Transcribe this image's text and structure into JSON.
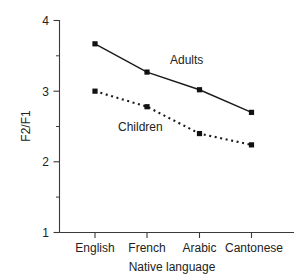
{
  "chart_data": {
    "type": "line",
    "title": "",
    "xlabel": "Native language",
    "ylabel": "F2/F1",
    "categories": [
      "English",
      "French",
      "Arabic",
      "Cantonese"
    ],
    "series": [
      {
        "name": "Adults",
        "style": "solid",
        "marker": "square",
        "values": [
          3.67,
          3.27,
          3.02,
          2.7
        ]
      },
      {
        "name": "Children",
        "style": "dotted",
        "marker": "square",
        "values": [
          3.0,
          2.78,
          2.4,
          2.24
        ]
      }
    ],
    "ylim": [
      1,
      4
    ],
    "yticks": [
      1,
      2,
      3,
      4
    ],
    "ytick_labels": [
      "1",
      "2",
      "3",
      "4"
    ],
    "yticks_minor": [
      1.5,
      2.5,
      3.5
    ],
    "grid": false,
    "legend": "inline-annotations"
  },
  "axes": {
    "y_tick_1": "1",
    "y_tick_2": "2",
    "y_tick_3": "3",
    "y_tick_4": "4",
    "y_axis_title": "F2/F1",
    "x_axis_title": "Native language",
    "x_cat_0": "English",
    "x_cat_1": "French",
    "x_cat_2": "Arabic",
    "x_cat_3": "Cantonese"
  },
  "annotations": {
    "adults": "Adults",
    "children": "Children"
  },
  "colors": {
    "line": "#1a1a1a",
    "axis": "#3a3a3a",
    "marker": "#111111",
    "background": "#ffffff"
  }
}
